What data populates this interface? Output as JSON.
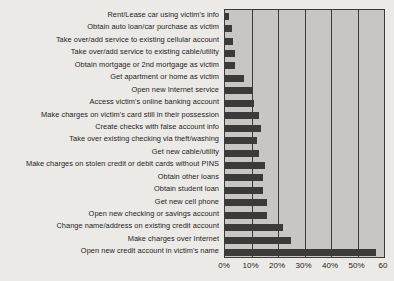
{
  "chart_data": {
    "type": "bar",
    "orientation": "horizontal",
    "title": "",
    "subtitle": "",
    "xlabel": "",
    "ylabel": "",
    "xlim": [
      0,
      60
    ],
    "grid": true,
    "legend": "none",
    "tick_labels": [
      "0%",
      "10%",
      "20%",
      "30%",
      "40%",
      "50%",
      "60"
    ],
    "tick_values": [
      0,
      10,
      20,
      30,
      40,
      50,
      60
    ],
    "bar_color": "#3a3a39",
    "plot_background": "#c7c6c2",
    "page_background": "#eceae6",
    "categories": [
      "Rent/Lease car using victim's info",
      "Obtain auto loan/car purchase as victim",
      "Take over/add service to existing cellular account",
      "Take over/add service to existing cable/utility",
      "Obtain mortgage or 2nd mortgage as victim",
      "Get apartment or home as victim",
      "Open new Internet service",
      "Access victim's online banking account",
      "Make charges on victim's card still in their possession",
      "Create checks with false account info",
      "Take over existing checking via theft/washing",
      "Get new cable/utility",
      "Make charges on stolen credit or debit cards without PINS",
      "Obtain other loans",
      "Obtain student loan",
      "Get new cell phone",
      "Open new checking or savings account",
      "Change name/address on existing credit account",
      "Make charges over Internet",
      "Open new credit account in victim's name"
    ],
    "values": [
      1.5,
      2.5,
      3,
      3.7,
      3.8,
      7,
      10,
      11,
      13,
      13.5,
      12,
      13,
      15,
      14.5,
      14.5,
      16,
      16,
      22,
      25,
      57
    ]
  }
}
